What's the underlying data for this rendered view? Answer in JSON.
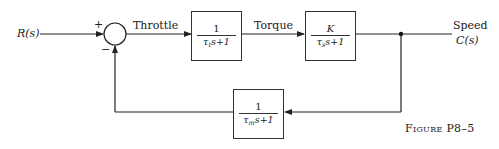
{
  "diagram": {
    "type": "block-diagram",
    "input": {
      "label": "R(s)"
    },
    "summing_junction": {
      "plus_sign": "+",
      "minus_sign": "−"
    },
    "signals": {
      "throttle": "Throttle",
      "torque": "Torque",
      "speed": "Speed"
    },
    "output": {
      "label": "C(s)"
    },
    "blocks": [
      {
        "id": "throttle-block",
        "numerator": "1",
        "den_tau": "τ",
        "den_sub": "t",
        "den_rest": "s+1"
      },
      {
        "id": "engine-block",
        "numerator": "K",
        "den_tau": "τ",
        "den_sub": "s",
        "den_rest": "s+1"
      },
      {
        "id": "feedback-block",
        "numerator": "1",
        "den_tau": "τ",
        "den_sub": "m",
        "den_rest": "s+1"
      }
    ],
    "caption": "Figure P8–5"
  }
}
